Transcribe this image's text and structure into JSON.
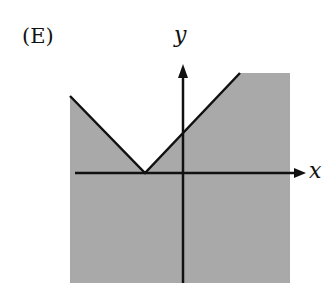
{
  "choice_label": "(E)",
  "axes": {
    "x_label": "x",
    "y_label": "y"
  },
  "graph": {
    "description": "Graph of y >= |x + a| region complement shaded: shaded region lies below V-shaped absolute value graph with vertex on negative x-axis",
    "vertex": "on negative x-axis",
    "shaded_region": "below the V",
    "boundary": "solid"
  },
  "colors": {
    "shade": "#a9a9a9",
    "line": "#111111",
    "background": "#ffffff"
  }
}
